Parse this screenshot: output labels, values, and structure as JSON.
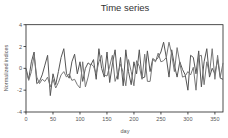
{
  "chart_data": {
    "type": "line",
    "title": "Time series",
    "xlabel": "day",
    "ylabel": "Normalized indices",
    "xlim": [
      0,
      365
    ],
    "ylim": [
      -4,
      4
    ],
    "xticks": [
      0,
      50,
      100,
      150,
      200,
      250,
      300,
      350
    ],
    "yticks": [
      -4,
      -2,
      0,
      2,
      4
    ],
    "grid": false,
    "legend": null,
    "x": [
      0,
      5,
      10,
      15,
      20,
      25,
      30,
      35,
      40,
      45,
      50,
      55,
      60,
      65,
      70,
      75,
      80,
      85,
      90,
      95,
      100,
      105,
      110,
      115,
      120,
      125,
      130,
      135,
      140,
      145,
      150,
      155,
      160,
      165,
      170,
      175,
      180,
      185,
      190,
      195,
      200,
      205,
      210,
      215,
      220,
      225,
      230,
      235,
      240,
      245,
      250,
      255,
      260,
      265,
      270,
      275,
      280,
      285,
      290,
      295,
      300,
      305,
      310,
      315,
      320,
      325,
      330,
      335,
      340,
      345,
      350,
      355,
      360,
      365
    ],
    "series": [
      {
        "name": "series 1",
        "color": "#555555",
        "values": [
          0.0,
          -1.0,
          0.6,
          1.5,
          -1.4,
          -1.2,
          -0.6,
          0.3,
          1.2,
          -2.5,
          -0.5,
          -1.5,
          -0.3,
          1.0,
          1.8,
          -0.5,
          -0.9,
          0.6,
          1.3,
          -0.5,
          0.6,
          -1.2,
          0.0,
          0.5,
          0.3,
          0.8,
          -1.0,
          1.8,
          0.0,
          -0.8,
          1.5,
          -1.3,
          0.4,
          1.7,
          -1.0,
          1.0,
          -1.6,
          1.7,
          -0.3,
          -1.5,
          0.6,
          -0.5,
          1.7,
          -0.9,
          -0.8,
          1.6,
          -0.3,
          0.9,
          0.7,
          1.0,
          1.5,
          2.4,
          1.0,
          -0.8,
          1.7,
          0.3,
          -0.8,
          0.6,
          -0.1,
          -0.6,
          -2.0,
          1.2,
          1.0,
          -0.5,
          1.6,
          -1.7,
          0.6,
          1.8,
          -0.8,
          0.0,
          -0.5,
          0.8,
          -0.9,
          -1.0
        ]
      },
      {
        "name": "series 2",
        "color": "#777777",
        "values": [
          -0.2,
          -1.1,
          -0.3,
          1.2,
          -0.8,
          -1.4,
          -1.0,
          -1.2,
          -0.8,
          -1.7,
          -1.0,
          -1.8,
          -1.3,
          -0.6,
          -0.3,
          -0.8,
          -0.5,
          -1.1,
          -1.0,
          -1.5,
          -1.8,
          0.6,
          -1.7,
          -0.8,
          0.4,
          0.2,
          -0.5,
          0.6,
          1.2,
          -0.6,
          -0.7,
          0.2,
          1.2,
          -1.2,
          -0.5,
          0.4,
          -0.4,
          -1.6,
          0.8,
          -0.3,
          -1.6,
          0.7,
          0.2,
          -1.0,
          1.3,
          -1.2,
          -1.2,
          0.8,
          0.6,
          1.4,
          0.6,
          0.7,
          1.0,
          2.4,
          1.3,
          -0.3,
          1.9,
          0.5,
          -0.8,
          -0.7,
          -0.3,
          -0.6,
          0.1,
          -2.0,
          1.1,
          1.2,
          -1.5,
          0.6,
          -0.5,
          1.8,
          -1.0,
          1.2,
          -0.8,
          0.5
        ]
      }
    ]
  }
}
